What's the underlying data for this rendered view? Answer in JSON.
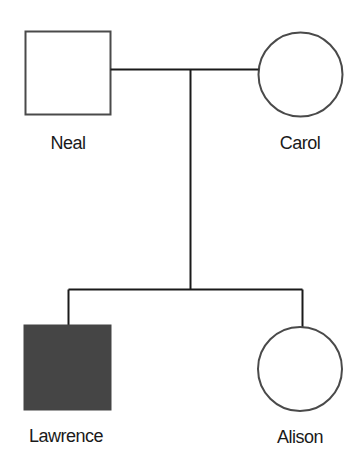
{
  "diagram": {
    "type": "pedigree",
    "colors": {
      "line": "#1a1a1a",
      "outline": "#4a4a4a",
      "affected_fill": "#454545",
      "unaffected_fill": "#ffffff",
      "label": "#1a1a1a"
    },
    "generations": [
      {
        "generation": 1,
        "individuals": [
          {
            "name": "Neal",
            "sex": "male",
            "shape": "square",
            "affected": false
          },
          {
            "name": "Carol",
            "sex": "female",
            "shape": "circle",
            "affected": false
          }
        ],
        "relationship": "mating"
      },
      {
        "generation": 2,
        "individuals": [
          {
            "name": "Lawrence",
            "sex": "male",
            "shape": "square",
            "affected": true
          },
          {
            "name": "Alison",
            "sex": "female",
            "shape": "circle",
            "affected": false
          }
        ],
        "relationship": "siblings"
      }
    ]
  },
  "labels": {
    "neal": "Neal",
    "carol": "Carol",
    "lawrence": "Lawrence",
    "alison": "Alison"
  }
}
